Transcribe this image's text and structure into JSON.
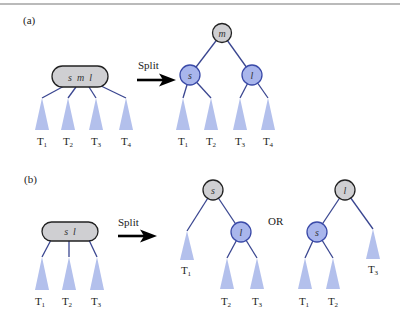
{
  "panels": {
    "a": {
      "label": "(a)",
      "before": {
        "node_keys": "s  m  l",
        "subtrees": [
          "T1",
          "T2",
          "T3",
          "T4"
        ]
      },
      "arrow_label": "Split",
      "after": {
        "root": "m",
        "left": "s",
        "right": "l",
        "subtrees": [
          "T1",
          "T2",
          "T3",
          "T4"
        ]
      }
    },
    "b": {
      "label": "(b)",
      "before": {
        "node_keys": "s  l",
        "subtrees": [
          "T1",
          "T2",
          "T3"
        ]
      },
      "arrow_label": "Split",
      "or_label": "OR",
      "option1": {
        "root": "s",
        "child": "l",
        "subtrees": [
          "T1",
          "T2",
          "T3"
        ]
      },
      "option2": {
        "root": "l",
        "child": "s",
        "subtrees": [
          "T1",
          "T2",
          "T3"
        ]
      }
    }
  },
  "colors": {
    "edge": "#3a4690",
    "subtree_fill": "#b3c0ec",
    "gray_node": "#cfcfd2",
    "blue_node": "#a9b6ec"
  }
}
